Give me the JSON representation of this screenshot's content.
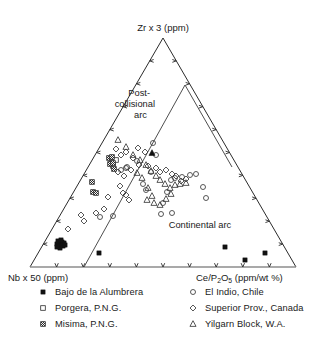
{
  "figure": {
    "type": "ternary-scatter",
    "apex_label": "Zr x 3 (ppm)",
    "left_label": "Nb x 50 (ppm)",
    "right_label_main": "Ce/P",
    "right_label_sub1": "2",
    "right_label_mid": "O",
    "right_label_sub2": "5",
    "right_label_tail": " (ppm/wt %)",
    "right_label_full": "Ce/P2O5 (ppm/wt %)",
    "fields": {
      "post_collisional_line1": "Post-",
      "post_collisional_line2": "collisional",
      "post_collisional_line3": "arc",
      "continental": "Continental arc"
    }
  },
  "legend": {
    "left_column": [
      {
        "marker": "filled-square",
        "label": "Bajo de la Alumbrera"
      },
      {
        "marker": "open-square",
        "label": "Porgera, P.N.G."
      },
      {
        "marker": "hatched-square",
        "label": "Misima, P.N.G."
      }
    ],
    "right_column": [
      {
        "marker": "open-circle",
        "label": "El Indio, Chile"
      },
      {
        "marker": "open-diamond",
        "label": "Superior Prov., Canada"
      },
      {
        "marker": "open-triangle",
        "label": "Yilgarn Block, W.A."
      }
    ]
  },
  "colors": {
    "ink": "#1a1a1a",
    "line": "#2b2b2b",
    "base_line": "#8c8c8c",
    "marker_fill": "#111111",
    "background": "#ffffff"
  },
  "chart_data": {
    "type": "scatter",
    "title": "",
    "xlabel": "",
    "ylabel": "",
    "projection": "ternary",
    "grid": false,
    "legend_position": "bottom",
    "axes": {
      "apex": {
        "name": "Zr x 3 (ppm)",
        "pixel": [
          163,
          38
        ]
      },
      "left": {
        "name": "Nb x 50 (ppm)",
        "pixel": [
          30,
          267
        ]
      },
      "right": {
        "name": "Ce/P2O5 (ppm/wt %)",
        "pixel": [
          296,
          267
        ]
      }
    },
    "ticks_per_edge": 9,
    "field_boundaries": [
      {
        "name": "post-collisional / continental divider",
        "points": [
          [
            185,
            85
          ],
          [
            84,
            267
          ]
        ]
      },
      {
        "name": "continental upper divider",
        "points": [
          [
            185,
            85
          ],
          [
            232,
            167
          ]
        ]
      }
    ],
    "series": [
      {
        "name": "Bajo de la Alumbrera",
        "marker": "filled-square",
        "points": [
          [
            57,
            244
          ],
          [
            60,
            243
          ],
          [
            62,
            242
          ],
          [
            59,
            246
          ],
          [
            62,
            245
          ],
          [
            64,
            243
          ],
          [
            58,
            241
          ],
          [
            61,
            240
          ],
          [
            63,
            246
          ],
          [
            60,
            248
          ],
          [
            65,
            245
          ],
          [
            57,
            247
          ],
          [
            99,
            253
          ],
          [
            225,
            247
          ],
          [
            245,
            260
          ],
          [
            265,
            253
          ]
        ]
      },
      {
        "name": "Porgera, P.N.G.",
        "marker": "open-square",
        "points": [
          [
            112,
            162
          ],
          [
            116,
            160
          ],
          [
            113,
            166
          ]
        ]
      },
      {
        "name": "Misima, P.N.G.",
        "marker": "hatched-square",
        "points": [
          [
            109,
            158
          ],
          [
            112,
            157
          ],
          [
            110,
            164
          ],
          [
            113,
            163
          ],
          [
            114,
            169
          ],
          [
            92,
            182
          ],
          [
            93,
            192
          ],
          [
            96,
            193
          ]
        ]
      },
      {
        "name": "El Indio, Chile",
        "marker": "open-circle",
        "points": [
          [
            151,
            172
          ],
          [
            143,
            184
          ],
          [
            146,
            190
          ],
          [
            121,
            170
          ],
          [
            127,
            167
          ],
          [
            163,
            203
          ],
          [
            171,
            180
          ],
          [
            175,
            178
          ],
          [
            182,
            177
          ],
          [
            167,
            192
          ],
          [
            190,
            175
          ],
          [
            196,
            174
          ],
          [
            203,
            187
          ],
          [
            161,
            214
          ],
          [
            172,
            213
          ],
          [
            206,
            198
          ],
          [
            100,
            217
          ],
          [
            113,
            216
          ],
          [
            126,
            168
          ],
          [
            137,
            161
          ],
          [
            153,
            143
          ],
          [
            156,
            155
          ]
        ]
      },
      {
        "name": "Superior Prov., Canada",
        "marker": "open-diamond",
        "points": [
          [
            116,
            149
          ],
          [
            121,
            155
          ],
          [
            126,
            152
          ],
          [
            118,
            172
          ],
          [
            124,
            176
          ],
          [
            131,
            170
          ],
          [
            120,
            186
          ],
          [
            123,
            193
          ],
          [
            126,
            195
          ],
          [
            129,
            200
          ],
          [
            108,
            197
          ],
          [
            96,
            213
          ],
          [
            104,
            209
          ],
          [
            81,
            215
          ],
          [
            138,
            148
          ],
          [
            145,
            152
          ],
          [
            133,
            158
          ],
          [
            139,
            165
          ],
          [
            148,
            166
          ],
          [
            156,
            168
          ],
          [
            160,
            172
          ],
          [
            166,
            170
          ],
          [
            172,
            174
          ],
          [
            176,
            176
          ],
          [
            181,
            181
          ],
          [
            186,
            179
          ],
          [
            68,
            229
          ],
          [
            84,
            221
          ]
        ]
      },
      {
        "name": "Yilgarn Block, W.A.",
        "marker": "open-triangle",
        "points": [
          [
            118,
            140
          ],
          [
            126,
            147
          ],
          [
            133,
            155
          ],
          [
            140,
            160
          ],
          [
            146,
            165
          ],
          [
            151,
            171
          ],
          [
            156,
            176
          ],
          [
            160,
            180
          ],
          [
            165,
            184
          ],
          [
            170,
            188
          ],
          [
            175,
            185
          ],
          [
            180,
            184
          ],
          [
            186,
            183
          ],
          [
            148,
            188
          ],
          [
            152,
            196
          ],
          [
            147,
            200
          ],
          [
            154,
            203
          ],
          [
            160,
            205
          ],
          [
            166,
            199
          ],
          [
            171,
            194
          ],
          [
            137,
            173
          ],
          [
            142,
            178
          ]
        ]
      },
      {
        "name": "Yilgarn Block, W.A. (filled)",
        "marker": "filled-triangle",
        "points": [
          [
            152,
            153
          ]
        ]
      }
    ]
  }
}
